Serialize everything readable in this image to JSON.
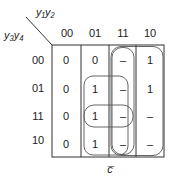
{
  "kmap": {
    "col_var_label": "y₁y₂",
    "row_var_label": "y₃y₄",
    "col_headers": [
      "00",
      "01",
      "11",
      "10"
    ],
    "row_headers": [
      "00",
      "01",
      "11",
      "10"
    ],
    "cells": [
      [
        "0",
        "0",
        "–",
        "1"
      ],
      [
        "0",
        "1",
        "–",
        "1"
      ],
      [
        "0",
        "1",
        "–",
        "–"
      ],
      [
        "0",
        "1",
        "–",
        "–"
      ]
    ],
    "bottom_label": "c̅",
    "groupings": [
      {
        "name": "column-11",
        "rows": [
          "00",
          "01",
          "11",
          "10"
        ],
        "cols": [
          "11"
        ]
      },
      {
        "name": "columns-11-10",
        "rows": [
          "00",
          "01",
          "11",
          "10"
        ],
        "cols": [
          "11",
          "10"
        ]
      },
      {
        "name": "cols-01-11-rows-01-10",
        "rows": [
          "01",
          "11",
          "10"
        ],
        "cols": [
          "01",
          "11"
        ]
      },
      {
        "name": "row-11-cols-01-11",
        "rows": [
          "11"
        ],
        "cols": [
          "01",
          "11"
        ]
      }
    ]
  }
}
